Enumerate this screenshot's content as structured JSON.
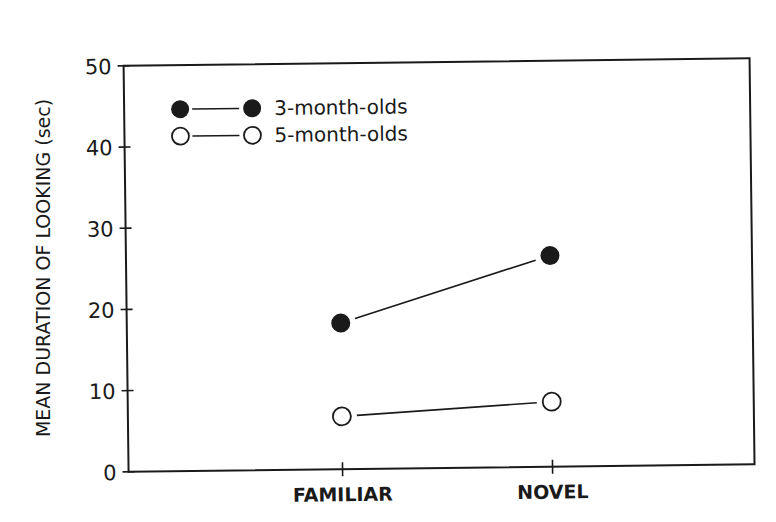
{
  "chart_data": {
    "type": "line",
    "title": "",
    "xlabel": "",
    "ylabel": "MEAN DURATION OF LOOKING (sec)",
    "categories": [
      "FAMILIAR",
      "NOVEL"
    ],
    "series": [
      {
        "name": "3-month-olds",
        "marker": "filled-circle",
        "values": [
          18,
          26
        ]
      },
      {
        "name": "5-month-olds",
        "marker": "open-circle",
        "values": [
          6.5,
          8
        ]
      }
    ],
    "ylim": [
      0,
      50
    ],
    "yticks": [
      0,
      10,
      20,
      30,
      40,
      50
    ],
    "grid": false,
    "legend_position": "upper-left",
    "colors": {
      "line": "#1a1a1a",
      "background": "#ffffff"
    }
  },
  "labels": {
    "ylabel": "MEAN DURATION OF LOOKING (sec)",
    "yticks": [
      "0",
      "10",
      "20",
      "30",
      "40",
      "50"
    ],
    "categories": [
      "FAMILIAR",
      "NOVEL"
    ],
    "legend": [
      "3-month-olds",
      "5-month-olds"
    ]
  }
}
